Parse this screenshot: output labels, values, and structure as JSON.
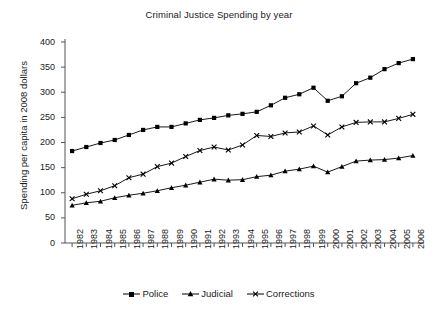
{
  "chart_data": {
    "type": "line",
    "title": "Criminal Justice Spending by year",
    "xlabel": "",
    "ylabel": "Spending per capita in 2008 dollars",
    "ylim": [
      0,
      400
    ],
    "yticks": [
      0,
      50,
      100,
      150,
      200,
      250,
      300,
      350,
      400
    ],
    "grid": false,
    "legend_position": "bottom",
    "categories": [
      "1982",
      "1983",
      "1984",
      "1985",
      "1986",
      "1987",
      "1988",
      "1989",
      "1990",
      "1991",
      "1992",
      "1993",
      "1994",
      "1995",
      "1996",
      "1997",
      "1998",
      "1999",
      "2000",
      "2001",
      "2002",
      "2003",
      "2004",
      "2005",
      "2006"
    ],
    "series": [
      {
        "name": "Police",
        "marker": "square",
        "color": "#000000",
        "values": [
          183,
          191,
          199,
          205,
          215,
          225,
          231,
          231,
          238,
          245,
          249,
          254,
          257,
          261,
          274,
          289,
          296,
          309,
          283,
          292,
          318,
          329,
          346,
          358,
          366
        ]
      },
      {
        "name": "Judicial",
        "marker": "triangle",
        "color": "#000000",
        "values": [
          75,
          80,
          83,
          90,
          95,
          99,
          104,
          110,
          115,
          121,
          127,
          125,
          126,
          132,
          135,
          143,
          147,
          153,
          141,
          152,
          163,
          165,
          166,
          169,
          174
        ]
      },
      {
        "name": "Corrections",
        "marker": "cross",
        "color": "#000000",
        "values": [
          88,
          97,
          104,
          114,
          130,
          137,
          152,
          159,
          172,
          184,
          191,
          185,
          195,
          214,
          212,
          219,
          221,
          233,
          215,
          231,
          240,
          241,
          241,
          248,
          256
        ]
      }
    ]
  },
  "legend": {
    "items": [
      {
        "label": "Police"
      },
      {
        "label": "Judicial"
      },
      {
        "label": "Corrections"
      }
    ]
  },
  "axes": {
    "y_title": "Spending per capita in 2008 dollars"
  }
}
